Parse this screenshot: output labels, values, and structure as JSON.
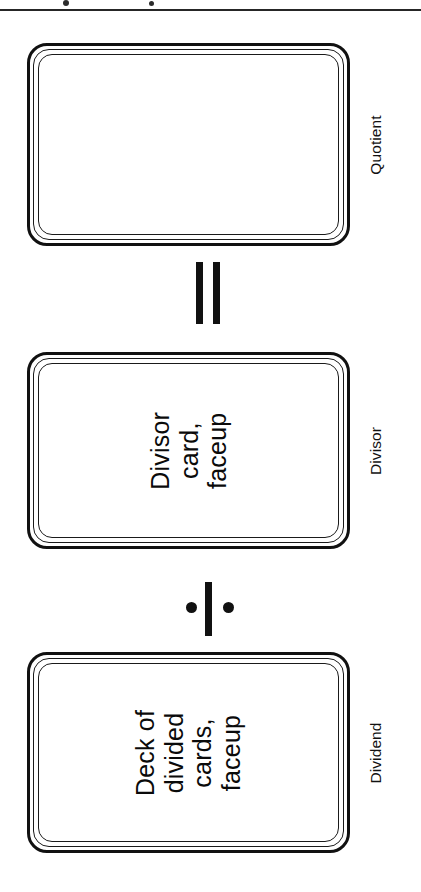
{
  "figure": {
    "orientation": "rotated-90-ccw",
    "background_color": "#ffffff",
    "ink_color": "#111111",
    "page_rule_present": true
  },
  "cards": [
    {
      "id": "quotient",
      "label": "Quotient",
      "lines": [],
      "empty": true
    },
    {
      "id": "divisor",
      "label": "Divisor",
      "lines": [
        "Divisor",
        "card,",
        "faceup"
      ],
      "empty": false
    },
    {
      "id": "dividend",
      "label": "Dividend",
      "lines": [
        "Deck of",
        "divided",
        "cards,",
        "faceup"
      ],
      "empty": false
    }
  ],
  "card_text": {
    "quotient": {
      "line0": "",
      "line1": "",
      "line2": "",
      "line3": ""
    },
    "divisor": {
      "line0": "Divisor",
      "line1": "card,",
      "line2": "faceup"
    },
    "dividend": {
      "line0": "Deck of",
      "line1": "divided",
      "line2": "cards,",
      "line3": "faceup"
    }
  },
  "labels": {
    "quotient": "Quotient",
    "divisor": "Divisor",
    "dividend": "Dividend"
  },
  "operators": {
    "equals": {
      "symbol": "=",
      "name": "equals-sign"
    },
    "divide": {
      "symbol": "÷",
      "name": "division-sign"
    }
  },
  "equation": "Dividend ÷ Divisor = Quotient"
}
